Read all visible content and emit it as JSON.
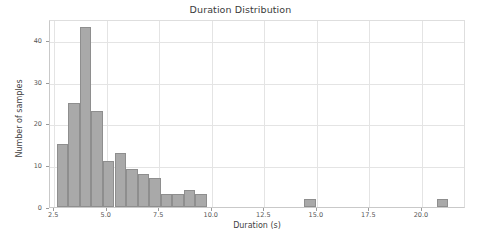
{
  "chart_data": {
    "type": "bar",
    "title": "Duration Distribution",
    "xlabel": "Duration (s)",
    "ylabel": "Number of samples",
    "xlim": [
      2.3,
      22.1
    ],
    "ylim": [
      0,
      45
    ],
    "grid": true,
    "legend": null,
    "bin_width": 0.55,
    "bar_color": "#a9a9a9",
    "bar_edge_color": "#8e8e8e",
    "xticks": [
      "2.5",
      "5.0",
      "7.5",
      "10.0",
      "12.5",
      "15.0",
      "17.5",
      "20.0"
    ],
    "xtick_values": [
      2.5,
      5.0,
      7.5,
      10.0,
      12.5,
      15.0,
      17.5,
      20.0
    ],
    "yticks": [
      "0",
      "10",
      "20",
      "30",
      "40"
    ],
    "ytick_values": [
      0,
      10,
      20,
      30,
      40
    ],
    "bins": [
      {
        "x0": 2.62,
        "x1": 3.17,
        "value": 15
      },
      {
        "x0": 3.17,
        "x1": 3.72,
        "value": 25
      },
      {
        "x0": 3.72,
        "x1": 4.27,
        "value": 43
      },
      {
        "x0": 4.27,
        "x1": 4.82,
        "value": 23
      },
      {
        "x0": 4.82,
        "x1": 5.37,
        "value": 11
      },
      {
        "x0": 5.37,
        "x1": 5.92,
        "value": 13
      },
      {
        "x0": 5.92,
        "x1": 6.47,
        "value": 9
      },
      {
        "x0": 6.47,
        "x1": 7.02,
        "value": 8
      },
      {
        "x0": 7.02,
        "x1": 7.57,
        "value": 7
      },
      {
        "x0": 7.57,
        "x1": 8.12,
        "value": 3
      },
      {
        "x0": 8.12,
        "x1": 8.67,
        "value": 3
      },
      {
        "x0": 8.67,
        "x1": 9.22,
        "value": 4
      },
      {
        "x0": 9.22,
        "x1": 9.77,
        "value": 3
      },
      {
        "x0": 14.4,
        "x1": 14.95,
        "value": 2
      },
      {
        "x0": 20.7,
        "x1": 21.25,
        "value": 2
      }
    ],
    "categories": [
      "2.62-3.17",
      "3.17-3.72",
      "3.72-4.27",
      "4.27-4.82",
      "4.82-5.37",
      "5.37-5.92",
      "5.92-6.47",
      "6.47-7.02",
      "7.02-7.57",
      "7.57-8.12",
      "8.12-8.67",
      "8.67-9.22",
      "9.22-9.77",
      "14.40-14.95",
      "20.70-21.25"
    ],
    "values": [
      15,
      25,
      43,
      23,
      11,
      13,
      9,
      8,
      7,
      3,
      3,
      4,
      3,
      2,
      2
    ]
  }
}
